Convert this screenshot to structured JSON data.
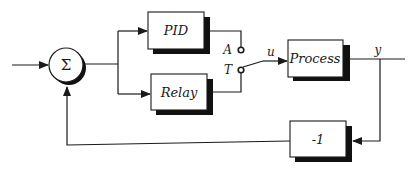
{
  "diagram": {
    "type": "block-diagram",
    "summing_junction": {
      "symbol": "Σ"
    },
    "blocks": {
      "pid": {
        "label": "PID"
      },
      "relay": {
        "label": "Relay"
      },
      "process": {
        "label": "Process"
      },
      "feedback": {
        "label": "-1"
      }
    },
    "switch": {
      "terminal_a": "A",
      "terminal_t": "T",
      "selected": "T"
    },
    "signals": {
      "control": "u",
      "output": "y"
    }
  }
}
